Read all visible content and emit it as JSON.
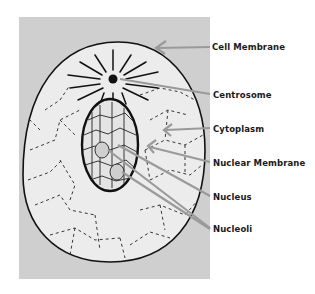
{
  "diagram": {
    "background_color": "#ffffff",
    "panel_color": "#cfcfcf",
    "cell_fill": "#ececec",
    "outline_color": "#111111",
    "arrow_color": "#9a9a9a",
    "labels": [
      {
        "id": "cell-membrane",
        "text": "Cell  Membrane",
        "x": 212,
        "y": 43
      },
      {
        "id": "centrosome",
        "text": "Centrosome",
        "x": 213,
        "y": 91
      },
      {
        "id": "cytoplasm",
        "text": "Cytoplasm",
        "x": 213,
        "y": 124
      },
      {
        "id": "nuclear-membrane",
        "text": "Nuclear  Membrane",
        "x": 213,
        "y": 158
      },
      {
        "id": "nucleus",
        "text": "Nucleus",
        "x": 213,
        "y": 192
      },
      {
        "id": "nucleoli",
        "text": "Nucleoli",
        "x": 213,
        "y": 225
      }
    ]
  }
}
